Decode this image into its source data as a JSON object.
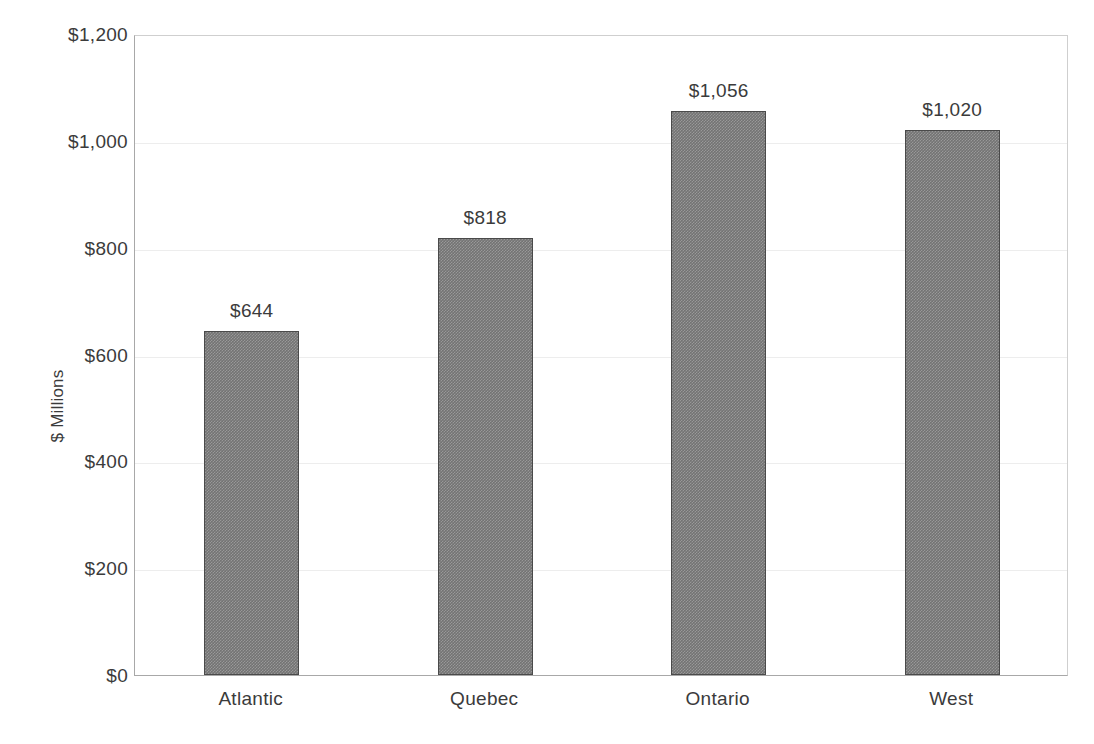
{
  "chart_data": {
    "type": "bar",
    "title": "",
    "subtitle": "",
    "xlabel": "",
    "ylabel": "$ Millions",
    "categories": [
      "Atlantic",
      "Quebec",
      "Ontario",
      "West"
    ],
    "values": [
      644,
      818,
      1056,
      1020
    ],
    "data_labels": [
      "$644",
      "$818",
      "$1,056",
      "$1,020"
    ],
    "ylim": [
      0,
      1200
    ],
    "y_tick_values": [
      0,
      200,
      400,
      600,
      800,
      1000,
      1200
    ],
    "y_tick_labels": [
      "$0",
      "$200",
      "$400",
      "$600",
      "$800",
      "$1,000",
      "$1,200"
    ],
    "grid": true,
    "grid_axis": "y",
    "legend": false,
    "legend_position": "none",
    "bar_fill_color": "#737373",
    "bar_border_color": "#4a4a4a",
    "gridline_color": "#ededed",
    "axis_color": "#a8a8a8",
    "text_color": "#3b3b3b"
  }
}
